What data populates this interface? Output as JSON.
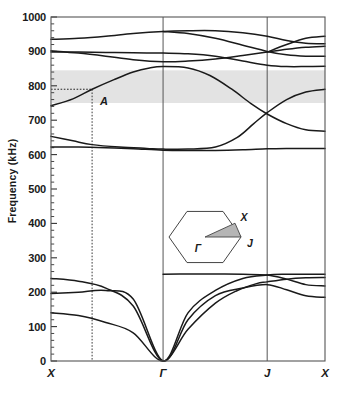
{
  "chart_data": {
    "type": "line",
    "title": "",
    "xlabel": "",
    "ylabel": "Frequency (kHz)",
    "ylim": [
      0,
      1000
    ],
    "ytick_values": [
      0,
      100,
      200,
      300,
      400,
      500,
      600,
      700,
      800,
      900,
      1000
    ],
    "ytick_labels": [
      "0",
      "100",
      "200",
      "300",
      "400",
      "500",
      "600",
      "700",
      "800",
      "900",
      "1000"
    ],
    "yminor_step": 20,
    "grid": "vertical-only-at-symmetry-points",
    "legend": "none",
    "x_axis_type": "symmetry-path",
    "xtick_points": [
      {
        "label": "X",
        "position": 0.0
      },
      {
        "label": "Γ",
        "position": 0.409
      },
      {
        "label": "J",
        "position": 0.789
      },
      {
        "label": "X",
        "position": 1.0
      }
    ],
    "bandgap": {
      "label": "complete band gap",
      "ymin": 750,
      "ymax": 845,
      "shading_color": "#e3e3e3"
    },
    "annotation": {
      "label": "A",
      "frequency": 790,
      "x_position": 0.15,
      "guide_lines": "dotted horizontal at 790 kHz from X axis to marker, dotted vertical down to x-axis"
    },
    "series": [
      {
        "name": "band-1-acoustic-lower",
        "points": [
          [
            0.0,
            140
          ],
          [
            0.1,
            132
          ],
          [
            0.2,
            112
          ],
          [
            0.3,
            82
          ],
          [
            0.409,
            0
          ],
          [
            0.5,
            92
          ],
          [
            0.6,
            168
          ],
          [
            0.68,
            205
          ],
          [
            0.75,
            225
          ],
          [
            0.789,
            230
          ],
          [
            0.86,
            238
          ],
          [
            0.93,
            242
          ],
          [
            1.0,
            243
          ]
        ]
      },
      {
        "name": "band-2-acoustic-middle",
        "points": [
          [
            0.0,
            196
          ],
          [
            0.1,
            200
          ],
          [
            0.2,
            205
          ],
          [
            0.3,
            180
          ],
          [
            0.409,
            0
          ],
          [
            0.5,
            120
          ],
          [
            0.6,
            190
          ],
          [
            0.7,
            212
          ],
          [
            0.789,
            222
          ],
          [
            0.86,
            207
          ],
          [
            0.93,
            190
          ],
          [
            1.0,
            185
          ]
        ]
      },
      {
        "name": "band-3-acoustic-upper",
        "points": [
          [
            0.0,
            240
          ],
          [
            0.1,
            232
          ],
          [
            0.2,
            212
          ],
          [
            0.3,
            160
          ],
          [
            0.409,
            0
          ],
          [
            0.5,
            140
          ],
          [
            0.6,
            205
          ],
          [
            0.7,
            240
          ],
          [
            0.789,
            250
          ],
          [
            0.86,
            252
          ],
          [
            0.93,
            252
          ],
          [
            1.0,
            252
          ]
        ]
      },
      {
        "name": "band-4-flat-250",
        "points": [
          [
            0.409,
            252
          ],
          [
            0.5,
            253
          ],
          [
            0.6,
            253
          ],
          [
            0.7,
            252
          ],
          [
            0.789,
            250
          ],
          [
            0.86,
            238
          ],
          [
            0.93,
            222
          ],
          [
            1.0,
            218
          ]
        ]
      },
      {
        "name": "band-5-lower-optical-620",
        "points": [
          [
            0.0,
            622
          ],
          [
            0.1,
            622
          ],
          [
            0.2,
            620
          ],
          [
            0.3,
            617
          ],
          [
            0.409,
            613
          ],
          [
            0.5,
            612
          ],
          [
            0.6,
            612
          ],
          [
            0.7,
            614
          ],
          [
            0.789,
            617
          ],
          [
            0.86,
            618
          ],
          [
            0.93,
            618
          ],
          [
            1.0,
            618
          ]
        ]
      },
      {
        "name": "band-6-653-descending",
        "points": [
          [
            0.0,
            653
          ],
          [
            0.08,
            640
          ],
          [
            0.15,
            629
          ],
          [
            0.25,
            622
          ],
          [
            0.35,
            618
          ],
          [
            0.409,
            616
          ],
          [
            0.5,
            616
          ],
          [
            0.6,
            622
          ],
          [
            0.68,
            650
          ],
          [
            0.74,
            690
          ],
          [
            0.789,
            722
          ],
          [
            0.86,
            760
          ],
          [
            0.93,
            782
          ],
          [
            1.0,
            790
          ]
        ]
      },
      {
        "name": "band-7-A-branch-rising",
        "points": [
          [
            0.0,
            742
          ],
          [
            0.08,
            762
          ],
          [
            0.15,
            790
          ],
          [
            0.23,
            818
          ],
          [
            0.3,
            840
          ],
          [
            0.36,
            852
          ],
          [
            0.409,
            856
          ],
          [
            0.5,
            852
          ],
          [
            0.58,
            830
          ],
          [
            0.66,
            790
          ],
          [
            0.73,
            748
          ],
          [
            0.789,
            718
          ],
          [
            0.86,
            690
          ],
          [
            0.93,
            672
          ],
          [
            1.0,
            668
          ]
        ]
      },
      {
        "name": "band-8-flat-900",
        "points": [
          [
            0.0,
            898
          ],
          [
            0.1,
            898
          ],
          [
            0.2,
            897
          ],
          [
            0.3,
            896
          ],
          [
            0.409,
            895
          ],
          [
            0.5,
            893
          ],
          [
            0.6,
            886
          ],
          [
            0.7,
            872
          ],
          [
            0.789,
            860
          ],
          [
            0.86,
            856
          ],
          [
            0.93,
            856
          ],
          [
            1.0,
            857
          ]
        ]
      },
      {
        "name": "band-9-descending-900-855",
        "points": [
          [
            0.0,
            902
          ],
          [
            0.1,
            895
          ],
          [
            0.2,
            886
          ],
          [
            0.3,
            876
          ],
          [
            0.409,
            870
          ],
          [
            0.5,
            872
          ],
          [
            0.6,
            878
          ],
          [
            0.7,
            888
          ],
          [
            0.789,
            898
          ],
          [
            0.86,
            906
          ],
          [
            0.93,
            912
          ],
          [
            1.0,
            915
          ]
        ]
      },
      {
        "name": "band-10-upper-935",
        "points": [
          [
            0.0,
            935
          ],
          [
            0.1,
            938
          ],
          [
            0.2,
            944
          ],
          [
            0.3,
            952
          ],
          [
            0.409,
            958
          ],
          [
            0.5,
            960
          ],
          [
            0.6,
            960
          ],
          [
            0.7,
            954
          ],
          [
            0.789,
            944
          ],
          [
            0.86,
            932
          ],
          [
            0.93,
            924
          ],
          [
            1.0,
            922
          ]
        ]
      },
      {
        "name": "band-11-top-crossing",
        "points": [
          [
            0.409,
            958
          ],
          [
            0.5,
            952
          ],
          [
            0.6,
            938
          ],
          [
            0.7,
            918
          ],
          [
            0.789,
            900
          ],
          [
            0.86,
            890
          ],
          [
            0.93,
            886
          ],
          [
            1.0,
            886
          ]
        ]
      },
      {
        "name": "band-12-upper-right-rise",
        "points": [
          [
            0.789,
            898
          ],
          [
            0.86,
            920
          ],
          [
            0.93,
            938
          ],
          [
            1.0,
            944
          ]
        ]
      }
    ]
  },
  "inset": {
    "name": "brillouin-zone-hexagon",
    "gamma_label": "Γ",
    "x_label": "X",
    "j_label": "J",
    "wedge_fill": "#b5b5b5"
  },
  "colors": {
    "line": "#1a1a1a",
    "axis": "#555555",
    "gap_shade": "#e3e3e3",
    "background": "#ffffff"
  }
}
